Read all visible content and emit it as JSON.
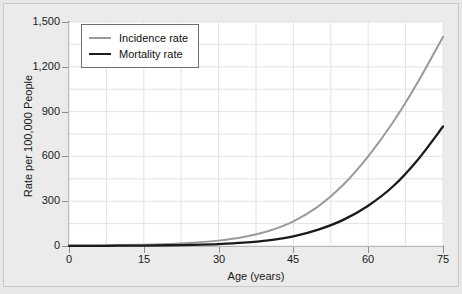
{
  "chart_data": {
    "type": "line",
    "title": "",
    "xlabel": "Age (years)",
    "ylabel": "Rate per 100,000 People",
    "xlim": [
      0,
      75
    ],
    "ylim": [
      0,
      1500
    ],
    "xticks": [
      "0",
      "15",
      "30",
      "45",
      "60",
      "75"
    ],
    "xtick_values": [
      0,
      15,
      30,
      45,
      60,
      75
    ],
    "yticks": [
      "0",
      "300",
      "600",
      "900",
      "1,200",
      "1,500"
    ],
    "ytick_values": [
      0,
      300,
      600,
      900,
      1200,
      1500
    ],
    "grid": true,
    "legend_position": "upper left",
    "x": [
      0,
      5,
      10,
      15,
      20,
      25,
      30,
      35,
      40,
      45,
      50,
      55,
      60,
      65,
      70,
      75
    ],
    "series": [
      {
        "name": "Incidence rate",
        "color": "#9a9a9a",
        "values": [
          3,
          4,
          6,
          9,
          14,
          22,
          36,
          60,
          100,
          165,
          265,
          410,
          600,
          830,
          1100,
          1400
        ]
      },
      {
        "name": "Mortality rate",
        "color": "#1a1a1a",
        "values": [
          1,
          1,
          2,
          3,
          5,
          8,
          13,
          22,
          38,
          65,
          110,
          175,
          270,
          400,
          580,
          800
        ]
      }
    ]
  },
  "legend": {
    "items": [
      {
        "label": "Incidence rate"
      },
      {
        "label": "Mortality rate"
      }
    ]
  },
  "axes": {
    "x_title": "Age (years)",
    "y_title": "Rate per 100,000 People"
  },
  "colors": {
    "incidence": "#9a9a9a",
    "mortality": "#1a1a1a",
    "figure_bg": "#ebebeb",
    "plot_bg": "#ffffff",
    "grid": "#e2e2ea",
    "axis": "#8d8d8d"
  }
}
